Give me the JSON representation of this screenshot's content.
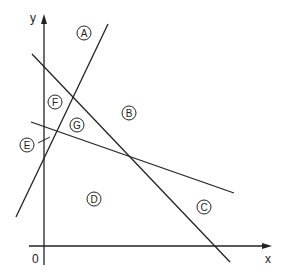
{
  "axes": {
    "x_label": "x",
    "y_label": "y",
    "origin_label": "0"
  },
  "regions": [
    {
      "id": "A",
      "label": "A"
    },
    {
      "id": "B",
      "label": "B"
    },
    {
      "id": "C",
      "label": "C"
    },
    {
      "id": "D",
      "label": "D"
    },
    {
      "id": "E",
      "label": "E"
    },
    {
      "id": "F",
      "label": "F"
    },
    {
      "id": "G",
      "label": "G"
    }
  ],
  "colors": {
    "line": "#222222",
    "background": "#ffffff"
  }
}
